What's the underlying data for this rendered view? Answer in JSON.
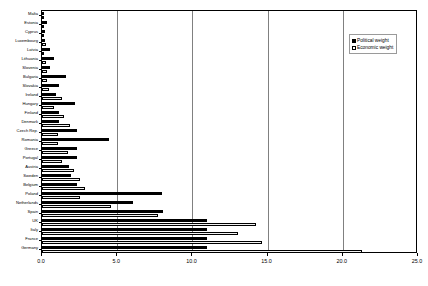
{
  "chart_data": {
    "type": "bar",
    "orientation": "horizontal",
    "title": "",
    "subtitle": "",
    "xlabel": "",
    "ylabel": "",
    "xlim": [
      0.0,
      25.0
    ],
    "xticks": [
      0.0,
      5.0,
      10.0,
      15.0,
      20.0,
      25.0
    ],
    "xtick_labels": [
      "0.0",
      "5.0",
      "10.0",
      "15.0",
      "20.0",
      "25.0"
    ],
    "grid": "vertical",
    "legend_position": "top-right",
    "categories": [
      "Malta",
      "Estonia",
      "Cyprus",
      "Luxembourg",
      "Latvia",
      "Lithuania",
      "Slovenia",
      "Bulgaria",
      "Slovakia",
      "Ireland",
      "Hungary",
      "Finland",
      "Denmark",
      "Czech Rep.",
      "Romania",
      "Greece",
      "Portugal",
      "Austria",
      "Sweden",
      "Belgium",
      "Poland",
      "Netherlands",
      "Spain",
      "UK",
      "Italy",
      "France",
      "Germany"
    ],
    "series": [
      {
        "name": "Political weight",
        "color": "#000000",
        "values": [
          0.1,
          0.3,
          0.2,
          0.2,
          0.55,
          0.8,
          0.5,
          1.6,
          1.15,
          0.95,
          2.2,
          1.15,
          1.15,
          2.3,
          4.45,
          2.3,
          2.3,
          1.8,
          1.9,
          2.3,
          8.0,
          6.05,
          8.05,
          11.0,
          11.0,
          11.0,
          11.0
        ]
      },
      {
        "name": "Economic weight",
        "color": "#f2f2f2",
        "values": [
          0.05,
          0.1,
          0.1,
          0.25,
          0.15,
          0.25,
          0.3,
          0.3,
          0.45,
          1.3,
          0.8,
          1.45,
          1.85,
          1.05,
          1.05,
          1.7,
          1.35,
          2.15,
          2.5,
          2.85,
          2.5,
          4.6,
          7.7,
          14.25,
          13.05,
          14.6,
          21.3
        ]
      }
    ]
  },
  "legend": {
    "items": [
      {
        "label": "Political weight",
        "swatch": "filled-square"
      },
      {
        "label": "Economic weight",
        "swatch": "hollow-square"
      }
    ]
  }
}
